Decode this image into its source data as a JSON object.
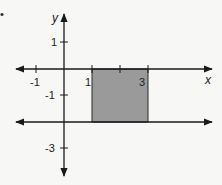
{
  "diagram": {
    "type": "coordinate-plane",
    "bullet": "•",
    "axes": {
      "x_label": "x",
      "y_label": "y"
    },
    "x_ticks": [
      {
        "value": -1,
        "label": "-1"
      },
      {
        "value": 1,
        "label": "1"
      },
      {
        "value": 2,
        "label": ""
      },
      {
        "value": 3,
        "label": "3"
      }
    ],
    "y_ticks": [
      {
        "value": 1,
        "label": "1"
      },
      {
        "value": -1,
        "label": "-1"
      },
      {
        "value": -3,
        "label": "-3"
      }
    ],
    "lines": [
      {
        "name": "x-axis",
        "equation": "y = 0"
      },
      {
        "name": "horizontal-line",
        "equation": "y = -2"
      }
    ],
    "shaded_region": {
      "x_min": 1,
      "x_max": 3,
      "y_min": -2,
      "y_max": 0,
      "fill": "#9a9a9a"
    },
    "colors": {
      "background": "#f7f7f5",
      "line": "#1a1a1a",
      "shade": "#9a9a9a"
    }
  }
}
